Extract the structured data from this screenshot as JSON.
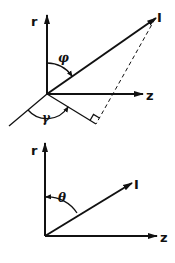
{
  "diagram_top": {
    "axis_r_label": "r",
    "axis_z_label": "z",
    "vector_label": "I",
    "angle_phi_label": "φ",
    "angle_gamma_label": "γ",
    "has_right_angle_mark": true,
    "has_dashed_projection": true
  },
  "diagram_bottom": {
    "axis_r_label": "r",
    "axis_z_label": "z",
    "vector_label": "I",
    "angle_theta_label": "θ"
  },
  "colors": {
    "ink": "#111111",
    "background": "#ffffff"
  }
}
